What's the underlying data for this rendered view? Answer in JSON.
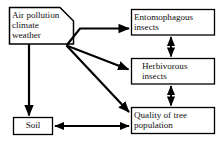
{
  "diagram": {
    "type": "flow-diagram",
    "background_color": "#ffffff",
    "line_color": "#000000",
    "text_color": "#111111",
    "nodes": [
      {
        "id": "sources",
        "label": "Air pollution\nclimate\nweather",
        "shape": "notched-rect",
        "x": 9,
        "y": 7,
        "width": 65,
        "height": 37
      },
      {
        "id": "entomophagous",
        "label": "Entomophagous\ninsects",
        "shape": "rect",
        "x": 131,
        "y": 9,
        "width": 84,
        "height": 26
      },
      {
        "id": "herbivorous",
        "label": "Herbivorous\ninsects",
        "shape": "rect",
        "x": 131,
        "y": 58,
        "width": 84,
        "height": 26
      },
      {
        "id": "quality",
        "label": "Quality of tree\npopulation",
        "shape": "rect",
        "x": 131,
        "y": 107,
        "width": 84,
        "height": 27
      },
      {
        "id": "soil",
        "label": "Soil",
        "shape": "rect",
        "x": 13,
        "y": 117,
        "width": 40,
        "height": 18
      }
    ],
    "edges": [
      {
        "id": "sources-to-entomophagous",
        "from": "sources",
        "to": "entomophagous",
        "direction": "one-way"
      },
      {
        "id": "sources-to-herbivorous",
        "from": "sources",
        "to": "herbivorous",
        "direction": "one-way"
      },
      {
        "id": "sources-to-quality",
        "from": "sources",
        "to": "quality",
        "direction": "one-way"
      },
      {
        "id": "sources-to-soil",
        "from": "sources",
        "to": "soil",
        "direction": "one-way"
      },
      {
        "id": "entomophagous-herbivorous",
        "from": "entomophagous",
        "to": "herbivorous",
        "direction": "two-way"
      },
      {
        "id": "herbivorous-quality",
        "from": "herbivorous",
        "to": "quality",
        "direction": "two-way"
      },
      {
        "id": "soil-quality",
        "from": "soil",
        "to": "quality",
        "direction": "two-way"
      }
    ]
  }
}
